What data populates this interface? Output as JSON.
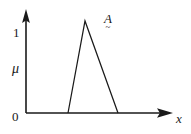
{
  "figure": {
    "background_color": "#ffffff",
    "ink_color": "#1a1a1a",
    "width": 191,
    "height": 134,
    "axes": {
      "y_axis_label": "μ",
      "x_axis_label": "x",
      "origin_label": "0",
      "y_top_tick_label": "1",
      "y_axis_icon": "up-arrow-axis-icon",
      "x_axis_icon": "right-arrow-axis-icon"
    },
    "annotations": {
      "set_letter": "A",
      "set_tilde": "~",
      "set_full_label": "A̰"
    }
  },
  "chart_data": {
    "type": "line",
    "title": "",
    "subtitle": "",
    "xlabel": "x",
    "ylabel": "μ",
    "grid": false,
    "legend": null,
    "legend_position": "none",
    "xlim": [
      0,
      1
    ],
    "ylim": [
      0,
      1.08
    ],
    "xticks": [],
    "xticklabels": [],
    "yticks": [
      0,
      1
    ],
    "yticklabels": [
      "0",
      "1"
    ],
    "annotations": [
      {
        "text": "A̰",
        "x": 0.61,
        "y": 1.0,
        "note": "fuzzy set name A with under-tilde, placed right of the peak"
      }
    ],
    "series": [
      {
        "name": "A̰",
        "kind": "triangular-membership-function",
        "color": "#1a1a1a",
        "x": [
          0.305,
          0.428,
          0.667
        ],
        "values": [
          0,
          1,
          0
        ],
        "points_px": [
          {
            "x": 68,
            "y": 113
          },
          {
            "x": 85,
            "y": 21
          },
          {
            "x": 118,
            "y": 113
          }
        ]
      }
    ],
    "axis_geometry_px": {
      "y_axis_x": 26,
      "y_axis_top": 14,
      "y_axis_arrow_tip_y": 9,
      "x_axis_y": 113,
      "x_axis_right": 164,
      "x_axis_arrow_tip_x": 173,
      "mu_one_level_y": 21
    }
  }
}
